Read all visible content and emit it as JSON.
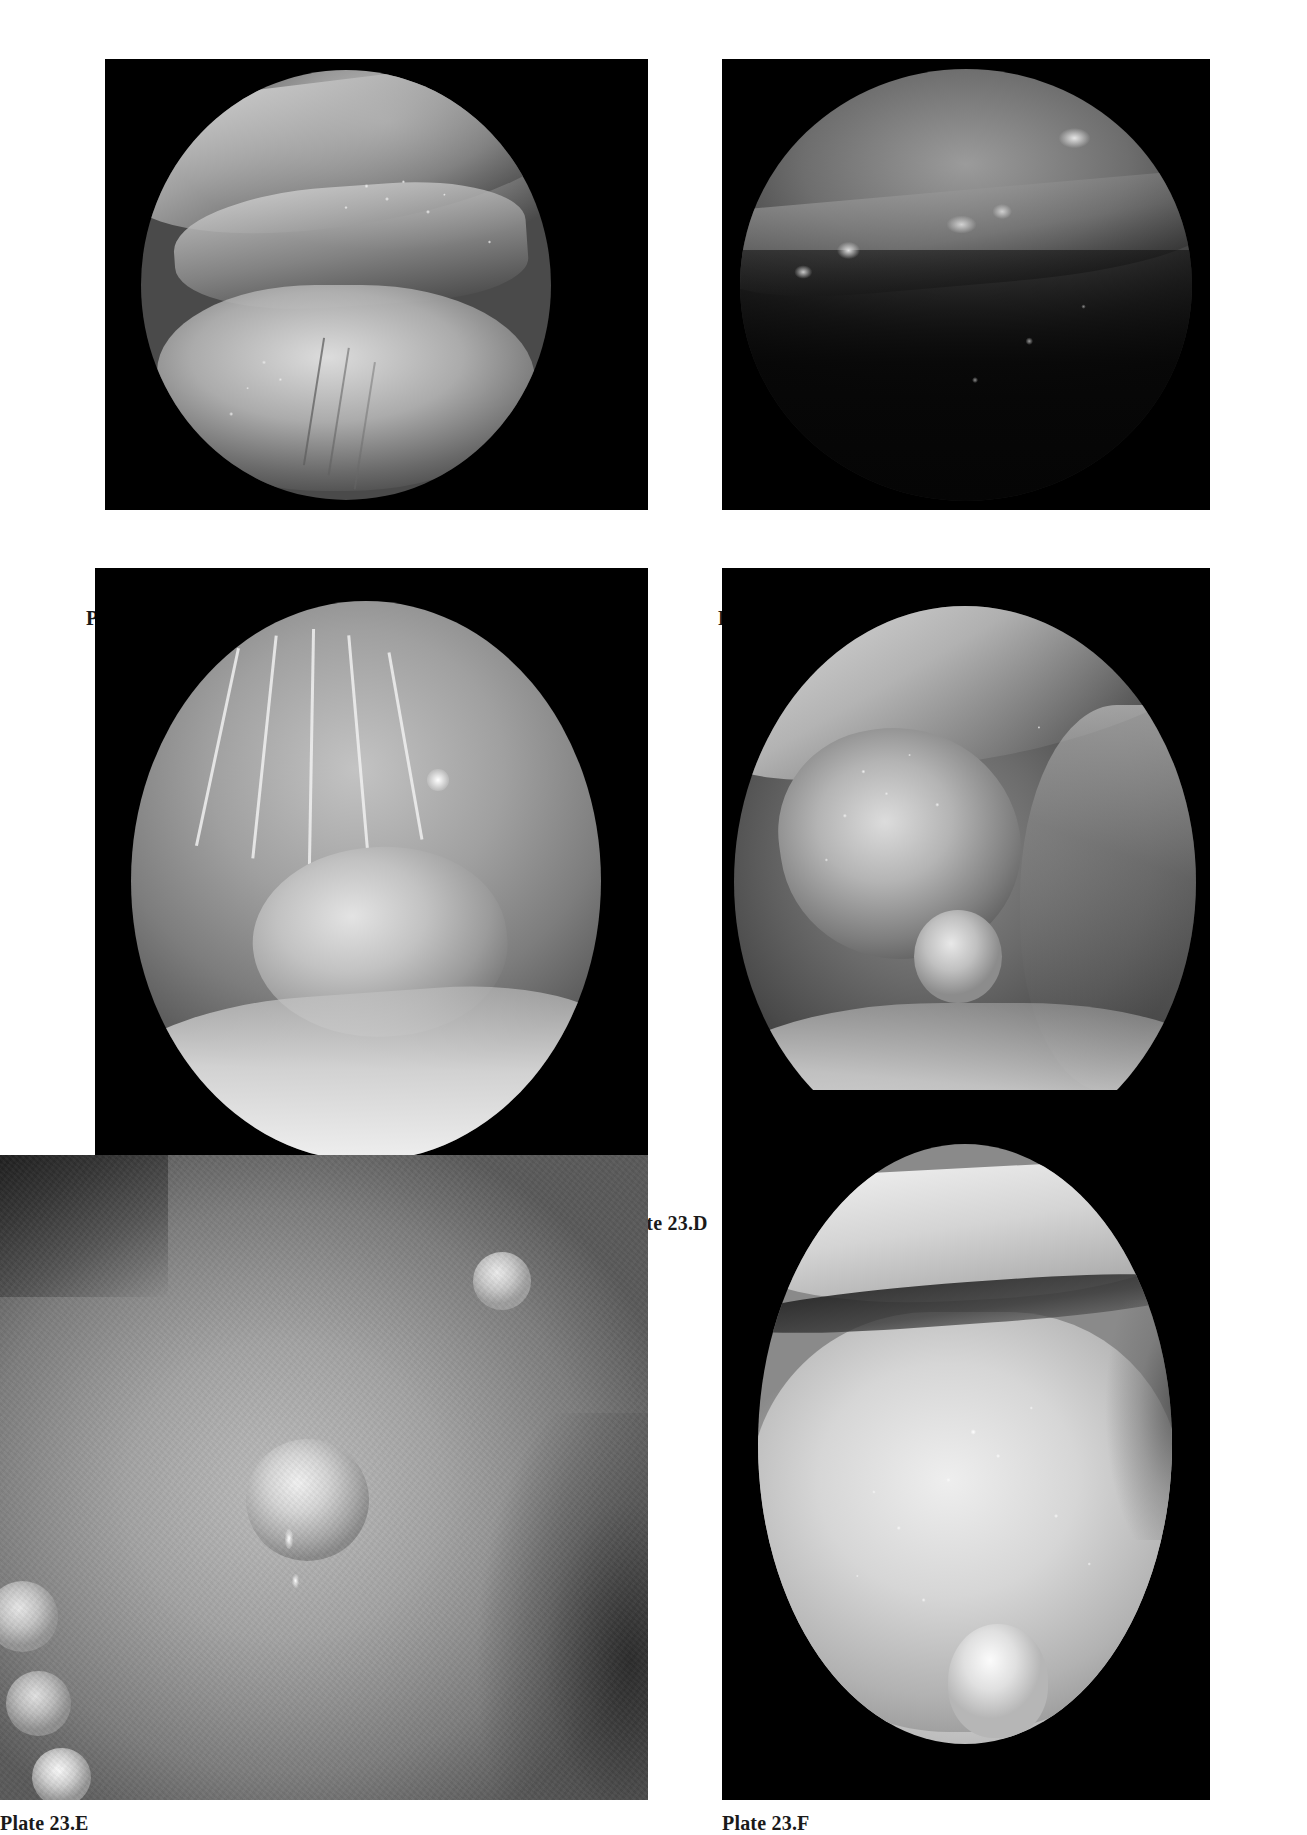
{
  "page": {
    "background_color": "#ffffff",
    "width": 1307,
    "height": 1835,
    "kind": "photographic-plate-page"
  },
  "plates": [
    {
      "id": "a",
      "caption": "Plate 23.A",
      "frame_color": "#000000",
      "field_shape": "circle",
      "description": "Endoscopic view, circular field, pale mucosal folds with scattered bright nodules"
    },
    {
      "id": "b",
      "caption": "Plate 23.B",
      "frame_color": "#000000",
      "field_shape": "circle",
      "description": "Dark endoscopic view, circular field, bright plaques along a ridge in the upper half"
    },
    {
      "id": "c",
      "caption": "Plate 23.C",
      "frame_color": "#000000",
      "field_shape": "circle",
      "description": "Endoscopic view, circular field, pale strands and a rounded lobe with a specular highlight"
    },
    {
      "id": "d",
      "caption": "Plate 23.D",
      "frame_color": "#000000",
      "field_shape": "circle",
      "description": "Endoscopic view, circular field, granular mass with adjacent smooth nodule"
    },
    {
      "id": "e",
      "caption": "Plate 23.E",
      "frame_color": "#000000",
      "field_shape": "rect",
      "description": "Close-up grainy view, rectangular field, multiple raised pale nodules with bright glints"
    },
    {
      "id": "f",
      "caption": "Plate 23.F",
      "frame_color": "#000000",
      "field_shape": "oval",
      "description": "Endoscopic view, oval field, pale lip-like fold above a nodular body surface"
    }
  ]
}
